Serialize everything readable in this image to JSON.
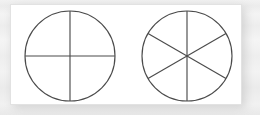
{
  "figure": {
    "background_color": "#ffffff",
    "panel_color": "#ffffff",
    "line_color": "#4b4b4b",
    "shadow_color": "#b9b9b9"
  },
  "chart_data": {
    "type": "pie",
    "xlabel": "",
    "ylabel": "",
    "grid": false,
    "legend": "none",
    "charts": [
      {
        "name": "circle-fourths",
        "slice_count": 4,
        "categories": [
          "1/4",
          "1/4",
          "1/4",
          "1/4"
        ],
        "values": [
          25,
          25,
          25,
          25
        ],
        "slice_angle_degrees": 90,
        "center_x": 70,
        "center_y": 56,
        "radius": 45,
        "diameters": [
          {
            "name": "vertical-diameter",
            "angle_degrees": 90
          },
          {
            "name": "horizontal-diameter",
            "angle_degrees": 0
          }
        ]
      },
      {
        "name": "circle-sixths",
        "slice_count": 6,
        "categories": [
          "1/6",
          "1/6",
          "1/6",
          "1/6",
          "1/6",
          "1/6"
        ],
        "values": [
          16.67,
          16.67,
          16.67,
          16.67,
          16.67,
          16.67
        ],
        "slice_angle_degrees": 60,
        "center_x": 187,
        "center_y": 56,
        "radius": 45,
        "diameters": [
          {
            "name": "vertical-diameter",
            "angle_degrees": 90
          },
          {
            "name": "diagonal-diameter-up",
            "angle_degrees": 30
          },
          {
            "name": "diagonal-diameter-down",
            "angle_degrees": 150
          }
        ]
      }
    ]
  }
}
